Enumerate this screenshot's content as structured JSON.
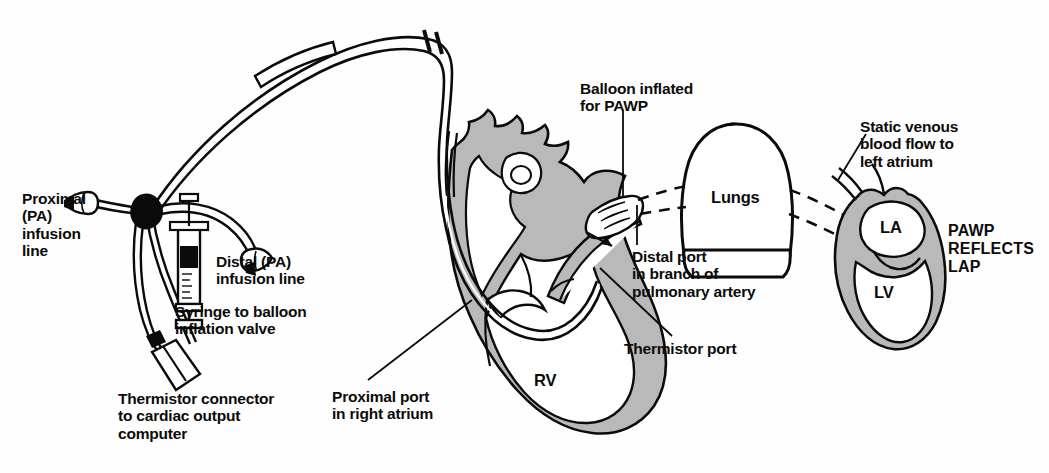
{
  "diagram": {
    "colors": {
      "ink": "#0b0b0b",
      "myocardium_gray": "#b9b9b9",
      "background": "#fefefe"
    }
  },
  "labels": {
    "proximal_pa_infusion_line": "Proximal\n(PA)\ninfusion\nline",
    "distal_pa_infusion_line": "Distal (PA)\ninfusion line",
    "syringe_to_balloon_inflation_valve": "Syringe to balloon\ninflation valve",
    "thermistor_connector": "Thermistor connector\nto cardiac output\ncomputer",
    "proximal_port_right_atrium": "Proximal port\nin right atrium",
    "balloon_inflated_for_pawp": "Balloon inflated\nfor PAWP",
    "distal_port_pulmonary_artery": "Distal port\nin branch of\npulmonary artery",
    "thermistor_port": "Thermistor port",
    "static_venous_blood_flow": "Static venous\nblood flow to\nleft atrium",
    "pawp_reflects_lap": "PAWP\nREFLECTS\nLAP"
  },
  "anatomy": {
    "right_ventricle": "RV",
    "lungs": "Lungs",
    "left_atrium": "LA",
    "left_ventricle": "LV"
  }
}
